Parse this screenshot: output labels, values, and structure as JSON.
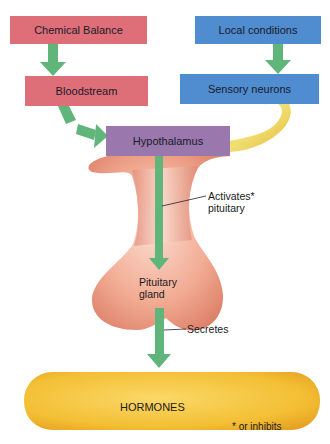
{
  "diagram": {
    "nodes": {
      "chemical_balance": "Chemical Balance",
      "local_conditions": "Local conditions",
      "bloodstream": "Bloodstream",
      "sensory_neurons": "Sensory neurons",
      "hypothalamus": "Hypothalamus",
      "pituitary_line1": "Pituitary",
      "pituitary_line2": "gland",
      "hormones": "HORMONES"
    },
    "annotations": {
      "activates_line1": "Activates*",
      "activates_line2": "pituitary",
      "secretes": "Secretes",
      "footnote": "* or inhibits"
    },
    "colors": {
      "chemical_box": "#de6f79",
      "local_box": "#4f8dd0",
      "hypothalamus_box": "#9a78ae",
      "arrow": "#5fb57a",
      "gland": "#f0a88e",
      "hormones": "#f3c236",
      "nerve": "#e6c84a"
    },
    "edges": [
      {
        "from": "Chemical Balance",
        "to": "Bloodstream"
      },
      {
        "from": "Local conditions",
        "to": "Sensory neurons"
      },
      {
        "from": "Bloodstream",
        "to": "Hypothalamus"
      },
      {
        "from": "Sensory neurons",
        "to": "Hypothalamus"
      },
      {
        "from": "Hypothalamus",
        "to": "Pituitary gland",
        "label": "Activates* pituitary"
      },
      {
        "from": "Pituitary gland",
        "to": "HORMONES",
        "label": "Secretes"
      }
    ]
  }
}
